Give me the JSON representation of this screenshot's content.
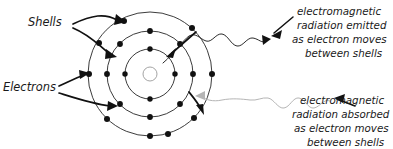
{
  "figure": {
    "background_color": "#ffffff",
    "labels": {
      "shells": "Shells",
      "electrons": "Electrons"
    },
    "callouts": {
      "emitted": {
        "lines": [
          "electromagnetic",
          "radiation emitted",
          "as electron moves",
          "between shells"
        ],
        "line1": "electromagnetic",
        "line2": "radiation emitted",
        "line3": "as electron moves",
        "line4": "between shells"
      },
      "absorbed": {
        "lines": [
          "electromagnetic",
          "radiation absorbed",
          "as electron moves",
          "between shells"
        ],
        "line1": "electromagnetic",
        "line2": "radiation absorbed",
        "line3": "as electron moves",
        "line4": "between shells"
      }
    },
    "colors": {
      "shell_stroke": "#262626",
      "electron_fill": "#111111",
      "nucleus_stroke": "#9a9a9a",
      "emitted_wave": "#2b2b2b",
      "absorbed_wave": "#b5b5b5",
      "text": "#1a1a1a"
    },
    "atom": {
      "center_x": 150,
      "center_y": 74,
      "nucleus_radius": 7,
      "shell_radii": [
        25,
        43,
        62
      ],
      "electron_radius": 2.7,
      "electron_counts": [
        4,
        8,
        9
      ]
    }
  }
}
